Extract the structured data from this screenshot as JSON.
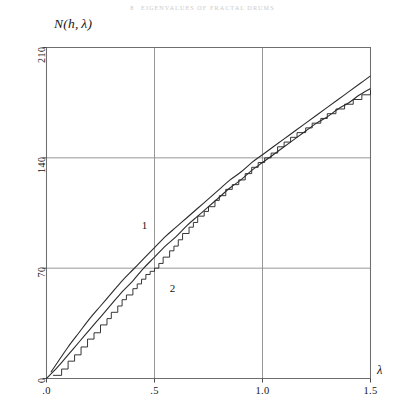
{
  "page": {
    "running_head_number": "8",
    "running_head_text": "EIGENVALUES OF FRACTAL DRUMS"
  },
  "chart_data": {
    "type": "line",
    "title": "",
    "subtitle": "",
    "xlabel": "λ",
    "ylabel": "N(h, λ)",
    "xlim": [
      0,
      1.5
    ],
    "ylim": [
      0,
      210
    ],
    "grid": true,
    "legend_position": "inline-labels",
    "xticks": [
      0,
      0.5,
      1.0,
      1.5
    ],
    "xticklabels": [
      ".0",
      ".5",
      "1.0",
      "1.5"
    ],
    "yticks": [
      0,
      70,
      140,
      210
    ],
    "yticklabels": [
      "0",
      "70",
      "140",
      "210"
    ],
    "annotations": [
      {
        "text": "1",
        "x": 0.455,
        "y": 96,
        "series": "curve-1"
      },
      {
        "text": "2",
        "x": 0.585,
        "y": 56,
        "series": "curve-2"
      }
    ],
    "series": [
      {
        "name": "1",
        "style": "smooth-line",
        "x": [
          0.02,
          0.05,
          0.1,
          0.15,
          0.2,
          0.25,
          0.3,
          0.35,
          0.4,
          0.45,
          0.5,
          0.55,
          0.6,
          0.65,
          0.7,
          0.75,
          0.8,
          0.85,
          0.9,
          0.95,
          1.0,
          1.05,
          1.1,
          1.15,
          1.2,
          1.25,
          1.3,
          1.35,
          1.4,
          1.45,
          1.5
        ],
        "y": [
          4,
          10,
          20,
          29,
          38,
          46,
          54,
          62,
          69,
          76,
          83,
          90,
          96,
          102,
          108,
          114,
          120,
          126,
          131,
          137,
          142,
          147,
          152,
          157,
          162,
          167,
          172,
          177,
          182,
          187,
          192
        ]
      },
      {
        "name": "2",
        "style": "smooth-line",
        "x": [
          0.0,
          0.05,
          0.1,
          0.15,
          0.2,
          0.25,
          0.3,
          0.35,
          0.4,
          0.45,
          0.5,
          0.55,
          0.6,
          0.65,
          0.7,
          0.75,
          0.8,
          0.85,
          0.9,
          0.95,
          1.0,
          1.05,
          1.1,
          1.15,
          1.2,
          1.25,
          1.3,
          1.35,
          1.4,
          1.45,
          1.5
        ],
        "y": [
          0,
          7,
          15,
          23,
          31,
          39,
          47,
          55,
          62,
          70,
          77,
          84,
          90,
          97,
          103,
          109,
          115,
          121,
          126,
          132,
          137,
          142,
          147,
          152,
          157,
          162,
          166,
          171,
          175,
          180,
          184
        ]
      },
      {
        "name": "staircase",
        "style": "step",
        "x": [
          0.03,
          0.07,
          0.1,
          0.13,
          0.16,
          0.19,
          0.22,
          0.25,
          0.28,
          0.3,
          0.33,
          0.35,
          0.37,
          0.4,
          0.42,
          0.44,
          0.46,
          0.48,
          0.5,
          0.52,
          0.54,
          0.57,
          0.59,
          0.61,
          0.63,
          0.66,
          0.68,
          0.7,
          0.73,
          0.75,
          0.78,
          0.8,
          0.83,
          0.86,
          0.89,
          0.92,
          0.95,
          0.98,
          1.01,
          1.04,
          1.07,
          1.1,
          1.13,
          1.16,
          1.2,
          1.23,
          1.27,
          1.3,
          1.34,
          1.38,
          1.42,
          1.46,
          1.5
        ],
        "y": [
          2,
          6,
          11,
          15,
          20,
          25,
          29,
          34,
          38,
          42,
          46,
          50,
          53,
          57,
          60,
          63,
          66,
          68,
          70,
          73,
          77,
          81,
          84,
          88,
          92,
          96,
          99,
          103,
          106,
          109,
          113,
          116,
          120,
          123,
          126,
          130,
          134,
          137,
          140,
          143,
          147,
          150,
          153,
          156,
          159,
          162,
          165,
          168,
          171,
          174,
          177,
          180,
          183
        ]
      }
    ]
  }
}
